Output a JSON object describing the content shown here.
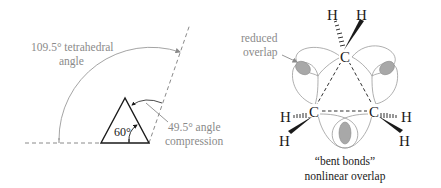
{
  "left_panel": {
    "title": "Angle strain in cyclopropane",
    "tetrahedral_label_line1": "109.5° tetrahedral",
    "tetrahedral_label_line2": "angle",
    "internal_angle_label": "60°",
    "compression_label_line1": "49.5° angle",
    "compression_label_line2": "compression"
  },
  "right_panel": {
    "title": "Bent bonds in cyclopropane",
    "reduced_overlap_line1": "reduced",
    "reduced_overlap_line2": "overlap",
    "atoms": {
      "c_top": "C",
      "c_left": "C",
      "c_right": "C",
      "h_top_left": "H",
      "h_top_right": "H",
      "h_left_upper": "H",
      "h_left_lower": "H",
      "h_right_upper": "H",
      "h_right_lower": "H"
    },
    "bent_bonds_line1": "“bent bonds”",
    "bent_bonds_line2": "nonlinear overlap"
  },
  "colors": {
    "line_black": "#1a1a1a",
    "annotation_gray": "#8a8a8a",
    "overlap_fill": "#a8a8a8",
    "lobe_stroke": "#9a9a9a"
  }
}
